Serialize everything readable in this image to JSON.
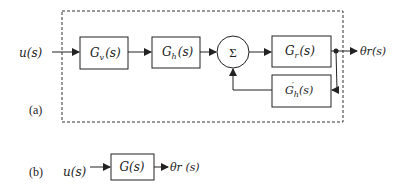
{
  "diagram": {
    "part_a": {
      "label": "(a)",
      "input": "u(s)",
      "output": "θr(s)",
      "blocks": {
        "gv": {
          "main": "G",
          "sub": "v",
          "arg": "(s)"
        },
        "gh": {
          "main": "G",
          "sub": "h",
          "arg": "(s)"
        },
        "sum": {
          "symbol": "Σ"
        },
        "gr": {
          "main": "G",
          "sub": "r",
          "arg": "(s)"
        },
        "feedback": {
          "main": "G",
          "sub": "h",
          "sup": "′",
          "arg": "(s)"
        }
      }
    },
    "part_b": {
      "label": "(b)",
      "input": "u(s)",
      "block": "G(s)",
      "output": "θr (s)"
    },
    "colors": {
      "stroke": "#222222",
      "background": "#ffffff"
    }
  }
}
